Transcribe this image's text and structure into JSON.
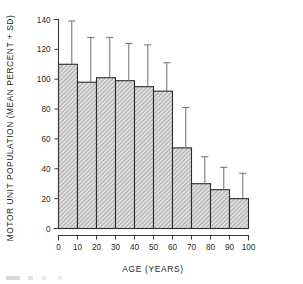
{
  "chart_data": {
    "type": "bar",
    "title": "",
    "xlabel": "AGE  (YEARS)",
    "ylabel": "MOTOR UNIT POPULATION (MEAN PERCENT + SD)",
    "categories": [
      "0-10",
      "10-20",
      "20-30",
      "30-40",
      "40-50",
      "50-60",
      "60-70",
      "70-80",
      "80-90",
      "90-100"
    ],
    "bar_left_edges": [
      0,
      10,
      20,
      30,
      40,
      50,
      60,
      70,
      80,
      90
    ],
    "bar_right_edges": [
      10,
      20,
      30,
      40,
      50,
      60,
      70,
      80,
      90,
      100
    ],
    "values": [
      110,
      98,
      101,
      99,
      95,
      92,
      54,
      30,
      26,
      20
    ],
    "error_upper": [
      139,
      128,
      128,
      124,
      123,
      111,
      81,
      48,
      41,
      37
    ],
    "sd": [
      29,
      30,
      27,
      25,
      28,
      19,
      27,
      18,
      15,
      17
    ],
    "xlim": [
      0,
      100
    ],
    "ylim": [
      0,
      140
    ],
    "xticks": [
      0,
      10,
      20,
      30,
      40,
      50,
      60,
      70,
      80,
      90,
      100
    ],
    "yticks": [
      0,
      20,
      40,
      60,
      80,
      100,
      120,
      140
    ],
    "xtick_labels": [
      "0",
      "10",
      "20",
      "30",
      "40",
      "50",
      "60",
      "70",
      "80",
      "90",
      "100"
    ],
    "ytick_labels": [
      "0",
      "20",
      "40",
      "60",
      "80",
      "100",
      "120",
      "140"
    ],
    "grid": false,
    "legend": null,
    "bar_fill": "diagonal-hatch",
    "error_bar_style": "upper-only-with-cap-at-bar-right-edge",
    "colors": {
      "axis": "#3a3a3a",
      "bar_outline": "#2a2a2a",
      "bar_fill": "#d8d8d8",
      "hatch": "#8a8a8a",
      "error_bar": "#6d6d6d",
      "background": "#ffffff",
      "text": "#1f1f1f"
    }
  }
}
